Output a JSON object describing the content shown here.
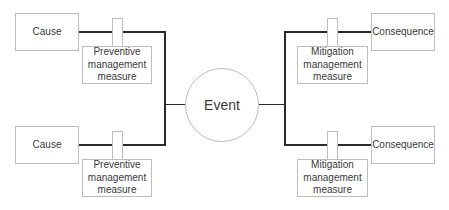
{
  "diagram": {
    "type": "bow-tie",
    "center": {
      "label": "Event"
    },
    "left_branches": [
      {
        "cause": "Cause",
        "barrier": "Preventive management measure"
      },
      {
        "cause": "Cause",
        "barrier": "Preventive management measure"
      }
    ],
    "right_branches": [
      {
        "consequence": "Consequence",
        "barrier": "Mitigation management measure"
      },
      {
        "consequence": "Consequence",
        "barrier": "Mitigation management measure"
      }
    ],
    "colors": {
      "line": "#2b2b2b",
      "border": "#bdbdbd",
      "text": "#3a3a3a"
    }
  }
}
